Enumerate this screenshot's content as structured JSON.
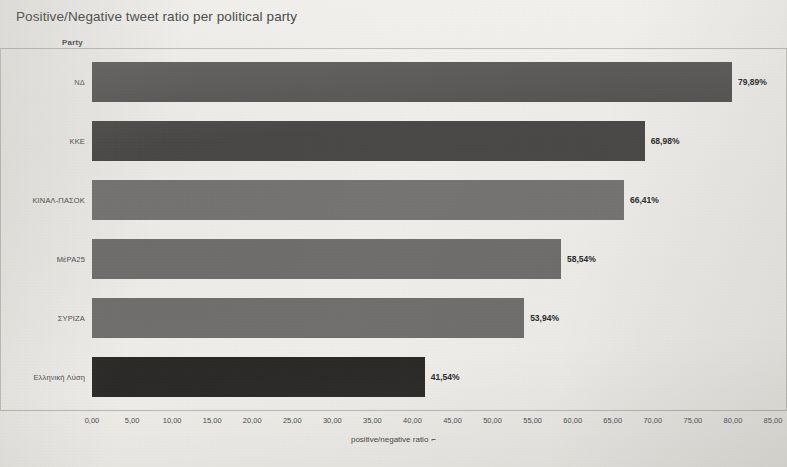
{
  "chart_data": {
    "type": "bar",
    "orientation": "horizontal",
    "title": "Positive/Negative tweet ratio per political party",
    "xlabel": "positive/negative ratio",
    "ylabel": "Party",
    "xlim": [
      0,
      85
    ],
    "grid": false,
    "legend": "none",
    "categories": [
      "ΝΔ",
      "ΚΚΕ",
      "ΚΙΝΑΛ-ΠΑΣΟΚ",
      "ΜέΡΑ25",
      "ΣΥΡΙΖΑ",
      "Ελληνική Λύση"
    ],
    "values": [
      79.89,
      68.98,
      66.41,
      58.54,
      53.94,
      41.54
    ],
    "value_labels": [
      "79,89%",
      "68,98%",
      "66,41%",
      "58,54%",
      "53,94%",
      "41,54%"
    ],
    "bar_colors": [
      "#555352",
      "#4a4846",
      "#767472",
      "#706e6c",
      "#716f6d",
      "#2b2928"
    ],
    "xticks": [
      0,
      5,
      10,
      15,
      20,
      25,
      30,
      35,
      40,
      45,
      50,
      55,
      60,
      65,
      70,
      75,
      80,
      85
    ],
    "xtick_labels": [
      "0,00",
      "5,00",
      "10,00",
      "15,00",
      "20,00",
      "25,00",
      "30,00",
      "35,00",
      "40,00",
      "45,00",
      "50,00",
      "55,00",
      "60,00",
      "65,00",
      "70,00",
      "75,00",
      "80,00",
      "85,00"
    ],
    "axis_title_marker": "⌐"
  },
  "background_color": "#efeeea",
  "frame_color": "#b9b7b1"
}
